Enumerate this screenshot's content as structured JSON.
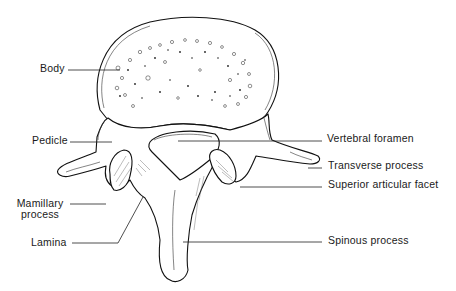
{
  "diagram": {
    "labels": {
      "body": "Body",
      "pedicle": "Pedicle",
      "vertebral_foramen": "Vertebral foramen",
      "transverse_process": "Transverse process",
      "superior_articular_facet": "Superior articular facet",
      "mamillary_process_line1": "Mamillary",
      "mamillary_process_line2": "process",
      "lamina": "Lamina",
      "spinous_process": "Spinous process"
    },
    "colors": {
      "ink": "#111111",
      "background": "#ffffff"
    }
  }
}
